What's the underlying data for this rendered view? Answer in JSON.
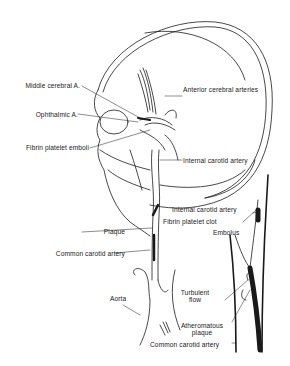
{
  "figure": {
    "colors": {
      "line": "#1a1a1a",
      "background": "#ffffff"
    }
  },
  "labels": {
    "middle_cerebral": "Middle cerebral A.",
    "anterior_cerebral": "Anterior cerebral arteries",
    "ophthalmic": "Ophthalmic A.",
    "fibrin_emboli": "Fibrin platelet emboli",
    "internal_carotid_1": "Internal carotid artery",
    "internal_carotid_2": "Internal carotid artery",
    "fibrin_clot": "Fibrin platelet clot",
    "embolus": "Embolus",
    "plaque": "Plaque",
    "common_carotid_1": "Common carotid artery",
    "aorta": "Aorta",
    "turbulent_line1": "Turbulent",
    "turbulent_line2": "flow",
    "athero_line1": "Atheromatous",
    "athero_line2": "plaque",
    "common_carotid_2": "Common carotid artery"
  }
}
